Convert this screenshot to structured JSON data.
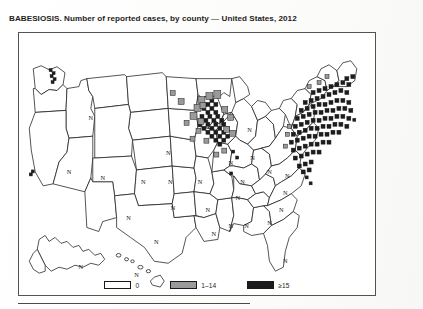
{
  "figure": {
    "title": "BABESIOSIS. Number of reported cases, by county — United States, 2012",
    "subject": "BABESIOSIS",
    "measure": "Number of reported cases, by county",
    "region": "United States",
    "year": "2012"
  },
  "legend": {
    "entries": [
      {
        "label": "0",
        "color": "#ffffff",
        "swatch_name": "legend-swatch-zero"
      },
      {
        "label": "1–14",
        "color": "#9a9a9a",
        "swatch_name": "legend-swatch-low"
      },
      {
        "label": "≥15",
        "color": "#1c1c1c",
        "swatch_name": "legend-swatch-high"
      }
    ]
  },
  "map": {
    "no_report_marker": "N",
    "border_color": "#54534f",
    "outline_color": "#1a1a1a",
    "no_report_states": [
      {
        "code": "ID",
        "label": "N",
        "x": 72,
        "y": 88
      },
      {
        "code": "NV",
        "label": "N",
        "x": 50,
        "y": 142
      },
      {
        "code": "UT",
        "label": "N",
        "x": 84,
        "y": 148
      },
      {
        "code": "CO",
        "label": "N",
        "x": 125,
        "y": 152
      },
      {
        "code": "NE",
        "label": "N",
        "x": 150,
        "y": 123
      },
      {
        "code": "KS",
        "label": "N",
        "x": 152,
        "y": 152
      },
      {
        "code": "OK",
        "label": "N",
        "x": 155,
        "y": 178
      },
      {
        "code": "NM",
        "label": "N",
        "x": 110,
        "y": 188
      },
      {
        "code": "TX",
        "label": "N",
        "x": 138,
        "y": 213
      },
      {
        "code": "AR",
        "label": "N",
        "x": 190,
        "y": 180
      },
      {
        "code": "LA",
        "label": "N",
        "x": 196,
        "y": 205
      },
      {
        "code": "MS",
        "label": "N",
        "x": 213,
        "y": 196
      },
      {
        "code": "TN",
        "label": "N",
        "x": 220,
        "y": 168
      },
      {
        "code": "AL",
        "label": "N",
        "x": 229,
        "y": 196
      },
      {
        "code": "GA",
        "label": "N",
        "x": 252,
        "y": 193
      },
      {
        "code": "FL",
        "label": "N",
        "x": 268,
        "y": 232
      },
      {
        "code": "SC",
        "label": "N",
        "x": 264,
        "y": 180
      },
      {
        "code": "NC",
        "label": "N",
        "x": 268,
        "y": 163
      },
      {
        "code": "VA",
        "label": "N",
        "x": 270,
        "y": 146
      },
      {
        "code": "WV",
        "label": "N",
        "x": 252,
        "y": 142
      },
      {
        "code": "KY",
        "label": "N",
        "x": 225,
        "y": 152
      },
      {
        "code": "IN",
        "label": "N",
        "x": 213,
        "y": 133
      },
      {
        "code": "OH",
        "label": "N",
        "x": 235,
        "y": 128
      },
      {
        "code": "MI",
        "label": "N",
        "x": 232,
        "y": 100
      },
      {
        "code": "MO",
        "label": "N",
        "x": 182,
        "y": 152
      },
      {
        "code": "AK",
        "label": "N",
        "x": 62,
        "y": 238
      },
      {
        "code": "HI",
        "label": "N",
        "x": 118,
        "y": 246
      }
    ]
  },
  "chart_data": {
    "type": "map",
    "title": "BABESIOSIS. Number of reported cases, by county — United States, 2012",
    "map_type": "choropleth-county",
    "legend_position": "bottom-center",
    "categories": [
      "0",
      "1–14",
      "≥15"
    ],
    "category_colors": [
      "#ffffff",
      "#9a9a9a",
      "#1c1c1c"
    ],
    "no_report_marker": "N",
    "no_report_marker_meaning": "Not a reportable condition in this state",
    "series": [
      {
        "name": "Reported babesiosis cases by county, 2012",
        "high_burden_states": [
          "NY",
          "CT",
          "RI",
          "MA",
          "NJ",
          "MN",
          "WI",
          "MD",
          "DE",
          "NH",
          "ME",
          "PA"
        ],
        "low_burden_states": [
          "MN",
          "WI",
          "WA",
          "ND",
          "IL",
          "VT",
          "ME",
          "NJ",
          "PA"
        ],
        "zero_states": [
          "CA",
          "OR",
          "MT",
          "WY",
          "SD",
          "IA",
          "PA",
          "NH",
          "VT"
        ]
      }
    ]
  }
}
